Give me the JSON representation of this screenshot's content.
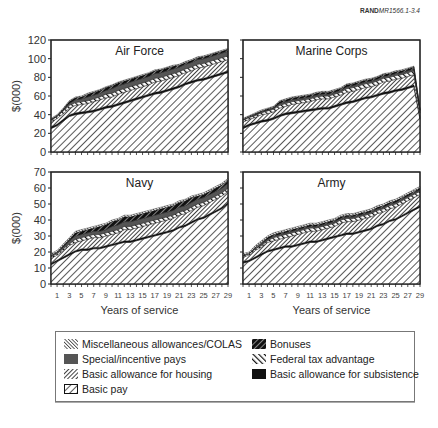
{
  "figure_id": {
    "brand": "RAND",
    "code": "MR1566.1-3.4"
  },
  "layout": {
    "ylabel": "$(000)",
    "xlabel": "Years of service"
  },
  "legend": {
    "items": [
      {
        "label": "Miscellaneous allowances/COLAS",
        "pattern": "misc"
      },
      {
        "label": "Special/incentive pays",
        "pattern": "special"
      },
      {
        "label": "Basic allowance for housing",
        "pattern": "bah"
      },
      {
        "label": "Basic pay",
        "pattern": "basic"
      },
      {
        "label": "Bonuses",
        "pattern": "bonus"
      },
      {
        "label": "Federal tax advantage",
        "pattern": "fta"
      },
      {
        "label": "Basic allowance for subsistence",
        "pattern": "bas"
      }
    ]
  },
  "chart_data": [
    {
      "type": "area",
      "title": "Air Force",
      "xlabel": "",
      "ylabel": "$(000)",
      "ylim": [
        0,
        120
      ],
      "yticks": [
        0,
        20,
        40,
        60,
        80,
        100,
        120
      ],
      "x": [
        1,
        2,
        3,
        4,
        5,
        6,
        7,
        8,
        9,
        10,
        11,
        12,
        13,
        14,
        15,
        16,
        17,
        18,
        19,
        20,
        21,
        22,
        23,
        24,
        25,
        26,
        27,
        28,
        29,
        30
      ],
      "xtick_labels": [],
      "series": [
        {
          "name": "Basic pay",
          "values": [
            25,
            28,
            33,
            38,
            40,
            41,
            42,
            43,
            45,
            47,
            48,
            50,
            52,
            54,
            56,
            58,
            60,
            62,
            63,
            65,
            67,
            69,
            72,
            74,
            76,
            77,
            79,
            81,
            83,
            85
          ]
        },
        {
          "name": "Basic allowance for subsistence",
          "values": [
            2,
            2,
            2,
            2,
            2,
            2,
            2,
            2,
            2,
            2,
            2,
            2,
            2,
            2,
            2,
            2,
            2,
            2,
            2,
            2,
            2,
            2,
            2,
            2,
            2,
            2,
            2,
            2,
            2,
            2
          ]
        },
        {
          "name": "Basic allowance for housing",
          "values": [
            5,
            6,
            6,
            7,
            8,
            8,
            8,
            9,
            9,
            9,
            9,
            10,
            10,
            10,
            10,
            10,
            10,
            11,
            11,
            11,
            11,
            11,
            11,
            11,
            12,
            12,
            12,
            12,
            12,
            12
          ]
        },
        {
          "name": "Federal tax advantage",
          "values": [
            2,
            2,
            3,
            3,
            3,
            3,
            3,
            3,
            3,
            4,
            4,
            4,
            4,
            4,
            4,
            4,
            4,
            4,
            4,
            4,
            4,
            4,
            4,
            4,
            4,
            4,
            4,
            4,
            4,
            4
          ]
        },
        {
          "name": "Special/incentive pays",
          "values": [
            1,
            1,
            1,
            2,
            3,
            3,
            4,
            4,
            4,
            4,
            5,
            5,
            5,
            5,
            5,
            5,
            5,
            5,
            5,
            5,
            5,
            5,
            5,
            5,
            5,
            5,
            5,
            5,
            5,
            5
          ]
        },
        {
          "name": "Bonuses",
          "values": [
            0,
            0,
            1,
            2,
            2,
            2,
            3,
            3,
            3,
            3,
            3,
            3,
            3,
            3,
            3,
            3,
            3,
            3,
            3,
            3,
            3,
            2,
            2,
            2,
            2,
            2,
            2,
            2,
            2,
            2
          ]
        },
        {
          "name": "Miscellaneous allowances/COLAS",
          "values": [
            1,
            1,
            1,
            1,
            1,
            1,
            1,
            1,
            1,
            1,
            1,
            1,
            1,
            1,
            1,
            1,
            1,
            1,
            1,
            1,
            1,
            1,
            1,
            1,
            1,
            1,
            1,
            1,
            1,
            1
          ]
        }
      ]
    },
    {
      "type": "area",
      "title": "Marine Corps",
      "xlabel": "",
      "ylabel": "",
      "ylim": [
        0,
        120
      ],
      "yticks": [
        0,
        20,
        40,
        60,
        80,
        100,
        120
      ],
      "x": [
        1,
        2,
        3,
        4,
        5,
        6,
        7,
        8,
        9,
        10,
        11,
        12,
        13,
        14,
        15,
        16,
        17,
        18,
        19,
        20,
        21,
        22,
        23,
        24,
        25,
        26,
        27,
        28,
        29,
        30
      ],
      "xtick_labels": [],
      "series": [
        {
          "name": "Basic pay",
          "values": [
            25,
            28,
            30,
            32,
            33,
            35,
            38,
            40,
            41,
            42,
            43,
            44,
            45,
            46,
            46,
            48,
            50,
            52,
            53,
            55,
            57,
            58,
            60,
            62,
            63,
            65,
            66,
            68,
            70,
            35
          ]
        },
        {
          "name": "Basic allowance for subsistence",
          "values": [
            2,
            2,
            2,
            2,
            2,
            2,
            2,
            2,
            2,
            2,
            2,
            2,
            2,
            2,
            2,
            2,
            2,
            2,
            2,
            2,
            2,
            2,
            2,
            2,
            2,
            2,
            2,
            2,
            2,
            2
          ]
        },
        {
          "name": "Basic allowance for housing",
          "values": [
            5,
            5,
            5,
            6,
            6,
            6,
            7,
            7,
            8,
            8,
            8,
            8,
            9,
            9,
            9,
            9,
            9,
            10,
            10,
            10,
            10,
            10,
            10,
            11,
            11,
            11,
            11,
            11,
            11,
            5
          ]
        },
        {
          "name": "Federal tax advantage",
          "values": [
            2,
            2,
            2,
            2,
            3,
            3,
            3,
            3,
            3,
            3,
            3,
            3,
            3,
            3,
            3,
            3,
            3,
            4,
            4,
            4,
            4,
            4,
            4,
            4,
            4,
            4,
            4,
            4,
            4,
            2
          ]
        },
        {
          "name": "Special/incentive pays",
          "values": [
            1,
            1,
            1,
            1,
            1,
            1,
            2,
            2,
            2,
            2,
            2,
            2,
            2,
            2,
            2,
            2,
            2,
            2,
            2,
            2,
            2,
            2,
            2,
            2,
            2,
            2,
            2,
            2,
            2,
            1
          ]
        },
        {
          "name": "Bonuses",
          "values": [
            0,
            0,
            1,
            1,
            1,
            1,
            2,
            2,
            2,
            2,
            2,
            2,
            2,
            2,
            2,
            2,
            2,
            2,
            2,
            2,
            2,
            2,
            2,
            2,
            2,
            2,
            2,
            2,
            2,
            0
          ]
        },
        {
          "name": "Miscellaneous allowances/COLAS",
          "values": [
            1,
            1,
            1,
            1,
            1,
            1,
            1,
            1,
            1,
            1,
            1,
            1,
            1,
            1,
            1,
            1,
            1,
            1,
            1,
            1,
            1,
            1,
            1,
            1,
            1,
            1,
            1,
            1,
            1,
            1
          ]
        }
      ]
    },
    {
      "type": "area",
      "title": "Navy",
      "xlabel": "Years of service",
      "ylabel": "$(000)",
      "ylim": [
        0,
        70
      ],
      "yticks": [
        0,
        10,
        20,
        30,
        40,
        50,
        60,
        70
      ],
      "x": [
        1,
        2,
        3,
        4,
        5,
        6,
        7,
        8,
        9,
        10,
        11,
        12,
        13,
        14,
        15,
        16,
        17,
        18,
        19,
        20,
        21,
        22,
        23,
        24,
        25,
        26,
        27,
        28,
        29,
        30
      ],
      "xtick_labels": [
        "1",
        "3",
        "5",
        "7",
        "9",
        "11",
        "13",
        "15",
        "17",
        "19",
        "21",
        "23",
        "25",
        "27",
        "29"
      ],
      "series": [
        {
          "name": "Basic pay",
          "values": [
            12,
            14,
            16,
            18,
            20,
            21,
            21,
            22,
            22,
            23,
            24,
            25,
            26,
            26,
            27,
            28,
            29,
            30,
            31,
            32,
            33,
            35,
            36,
            38,
            40,
            41,
            43,
            45,
            47,
            50
          ]
        },
        {
          "name": "Basic allowance for subsistence",
          "values": [
            1,
            1,
            1,
            1,
            1,
            1,
            1,
            1,
            1,
            1,
            1,
            1,
            1,
            1,
            1,
            1,
            1,
            1,
            1,
            1,
            1,
            1,
            1,
            1,
            1,
            1,
            1,
            1,
            1,
            1
          ]
        },
        {
          "name": "Basic allowance for housing",
          "values": [
            3,
            3,
            4,
            5,
            5,
            5,
            6,
            6,
            6,
            6,
            6,
            6,
            7,
            7,
            7,
            7,
            7,
            7,
            7,
            7,
            7,
            7,
            7,
            7,
            7,
            7,
            7,
            7,
            7,
            7
          ]
        },
        {
          "name": "Federal tax advantage",
          "values": [
            1,
            1,
            1,
            1,
            2,
            2,
            2,
            2,
            2,
            2,
            2,
            2,
            2,
            2,
            2,
            2,
            2,
            2,
            2,
            2,
            2,
            2,
            2,
            2,
            2,
            2,
            2,
            2,
            2,
            2
          ]
        },
        {
          "name": "Special/incentive pays",
          "values": [
            1,
            1,
            1,
            2,
            2,
            2,
            2,
            2,
            2,
            2,
            3,
            3,
            3,
            3,
            3,
            3,
            3,
            3,
            3,
            3,
            3,
            3,
            3,
            3,
            3,
            3,
            3,
            3,
            3,
            3
          ]
        },
        {
          "name": "Bonuses",
          "values": [
            0,
            0,
            1,
            1,
            2,
            2,
            2,
            2,
            3,
            3,
            3,
            3,
            3,
            3,
            3,
            3,
            3,
            3,
            3,
            3,
            3,
            3,
            3,
            3,
            2,
            2,
            2,
            2,
            2,
            2
          ]
        },
        {
          "name": "Miscellaneous allowances/COLAS",
          "values": [
            1,
            1,
            1,
            1,
            1,
            1,
            1,
            1,
            1,
            1,
            1,
            1,
            1,
            1,
            1,
            1,
            1,
            1,
            1,
            1,
            1,
            1,
            1,
            1,
            1,
            1,
            1,
            1,
            1,
            1
          ]
        }
      ]
    },
    {
      "type": "area",
      "title": "Army",
      "xlabel": "Years of service",
      "ylabel": "",
      "ylim": [
        0,
        70
      ],
      "yticks": [
        0,
        10,
        20,
        30,
        40,
        50,
        60,
        70
      ],
      "x": [
        1,
        2,
        3,
        4,
        5,
        6,
        7,
        8,
        9,
        10,
        11,
        12,
        13,
        14,
        15,
        16,
        17,
        18,
        19,
        20,
        21,
        22,
        23,
        24,
        25,
        26,
        27,
        28,
        29,
        30
      ],
      "xtick_labels": [
        "1",
        "3",
        "5",
        "7",
        "9",
        "11",
        "13",
        "15",
        "17",
        "19",
        "21",
        "23",
        "25",
        "27",
        "29"
      ],
      "series": [
        {
          "name": "Basic pay",
          "values": [
            13,
            14,
            16,
            18,
            20,
            21,
            22,
            23,
            23,
            24,
            25,
            26,
            26,
            27,
            28,
            29,
            30,
            31,
            31,
            32,
            33,
            34,
            36,
            37,
            39,
            40,
            42,
            44,
            46,
            48
          ]
        },
        {
          "name": "Basic allowance for subsistence",
          "values": [
            1,
            1,
            1,
            1,
            1,
            1,
            1,
            1,
            1,
            1,
            1,
            1,
            1,
            1,
            1,
            1,
            1,
            1,
            1,
            1,
            1,
            1,
            1,
            1,
            1,
            1,
            1,
            1,
            1,
            1
          ]
        },
        {
          "name": "Basic allowance for housing",
          "values": [
            3,
            3,
            4,
            4,
            5,
            5,
            5,
            5,
            6,
            6,
            6,
            6,
            6,
            6,
            6,
            6,
            7,
            7,
            7,
            7,
            7,
            7,
            7,
            7,
            7,
            7,
            7,
            7,
            7,
            7
          ]
        },
        {
          "name": "Federal tax advantage",
          "values": [
            1,
            1,
            1,
            1,
            1,
            2,
            2,
            2,
            2,
            2,
            2,
            2,
            2,
            2,
            2,
            2,
            2,
            2,
            2,
            2,
            2,
            2,
            2,
            2,
            2,
            2,
            2,
            2,
            2,
            2
          ]
        },
        {
          "name": "Special/incentive pays",
          "values": [
            0,
            0,
            0,
            1,
            1,
            1,
            1,
            1,
            1,
            1,
            1,
            1,
            1,
            1,
            1,
            1,
            1,
            1,
            1,
            1,
            1,
            1,
            1,
            1,
            1,
            1,
            1,
            1,
            1,
            1
          ]
        },
        {
          "name": "Bonuses",
          "values": [
            0,
            0,
            1,
            1,
            1,
            1,
            1,
            1,
            1,
            1,
            1,
            1,
            1,
            1,
            1,
            1,
            1,
            1,
            1,
            1,
            1,
            1,
            1,
            1,
            1,
            1,
            1,
            1,
            1,
            1
          ]
        },
        {
          "name": "Miscellaneous allowances/COLAS",
          "values": [
            1,
            1,
            1,
            1,
            1,
            1,
            1,
            1,
            1,
            1,
            1,
            1,
            1,
            1,
            1,
            1,
            1,
            1,
            1,
            1,
            1,
            1,
            1,
            1,
            1,
            1,
            1,
            1,
            1,
            1
          ]
        }
      ]
    }
  ]
}
